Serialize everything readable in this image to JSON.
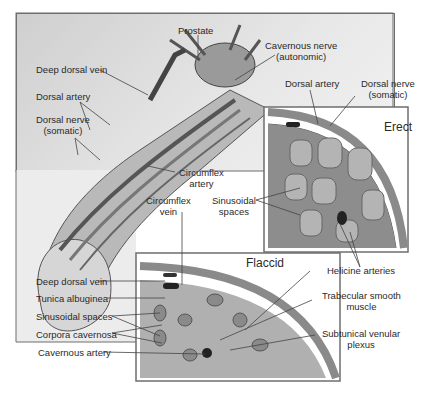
{
  "figure": {
    "main_labels": {
      "prostate": "Prostate",
      "cavernous_nerve_1": "Cavernous nerve",
      "cavernous_nerve_2": "(autonomic)",
      "deep_dorsal_vein": "Deep dorsal vein",
      "dorsal_artery": "Dorsal artery",
      "dorsal_nerve_1": "Dorsal nerve",
      "dorsal_nerve_2": "(somatic)",
      "circumflex_artery_1": "Circumflex",
      "circumflex_artery_2": "artery",
      "circumflex_vein_1": "Circumflex",
      "circumflex_vein_2": "vein"
    },
    "erect_inset": {
      "title": "Erect",
      "dorsal_artery": "Dorsal artery",
      "dorsal_nerve_1": "Dorsal nerve",
      "dorsal_nerve_2": "(somatic)",
      "sinusoidal_1": "Sinusoidal",
      "sinusoidal_2": "spaces",
      "helicine": "Helicine arteries"
    },
    "flaccid_inset": {
      "title": "Flaccid",
      "deep_dorsal_vein": "Deep dorsal vein",
      "tunica": "Tunica albuginea",
      "sinusoidal": "Sinusoidal spaces",
      "corpora": "Corpora cavernosa",
      "cavernous_artery": "Cavernous artery",
      "trabecular_1": "Trabecular smooth",
      "trabecular_2": "muscle",
      "subtunical_1": "Subtunical venular",
      "subtunical_2": "plexus"
    }
  }
}
